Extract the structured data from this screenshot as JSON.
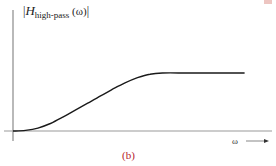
{
  "figure": {
    "caption": "(b)",
    "caption_color": "#b5222a",
    "y_axis_label": {
      "open_bar": "|",
      "symbol": "H",
      "subscript": "high-pass",
      "argument": " (ω)",
      "close_bar": "|"
    },
    "x_axis_label": "ω",
    "x_axis_arrow": "⟶"
  },
  "chart_data": {
    "type": "line",
    "title": "",
    "xlabel": "ω",
    "ylabel": "|H_high-pass (ω)|",
    "grid": false,
    "legend": null,
    "axis_ranges": {
      "x": [
        0,
        1
      ],
      "y": [
        0,
        1
      ]
    },
    "series": [
      {
        "name": "|H_high-pass(ω)|",
        "description": "High-pass filter magnitude response: near zero at low frequency, smooth S-shaped rise, flat passband plateau at high frequency",
        "x": [
          0.0,
          0.05,
          0.1,
          0.15,
          0.2,
          0.25,
          0.3,
          0.35,
          0.4,
          0.45,
          0.5,
          0.55,
          0.6,
          0.7,
          0.8,
          0.9,
          0.93
        ],
        "values": [
          0.0,
          0.01,
          0.05,
          0.13,
          0.24,
          0.36,
          0.48,
          0.6,
          0.72,
          0.83,
          0.92,
          0.98,
          1.0,
          1.0,
          1.0,
          1.0,
          1.0
        ]
      }
    ],
    "annotations": [
      "(b)"
    ]
  }
}
